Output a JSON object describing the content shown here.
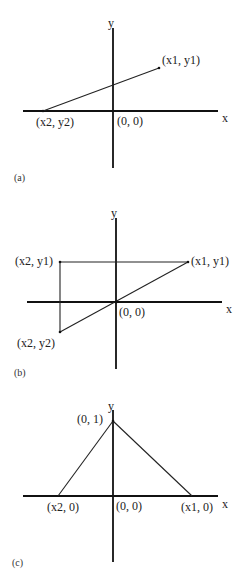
{
  "panels": [
    {
      "id": "a",
      "caption": "(a)",
      "axis_labels": {
        "x": "x",
        "y": "y"
      },
      "origin_label": "(0, 0)",
      "points": [
        {
          "name": "p1",
          "label": "(x1, y1)"
        },
        {
          "name": "p2",
          "label": "(x2, y2)"
        }
      ],
      "description": "Line segment from (x2, y2) on the negative x-axis to (x1, y1) in the first quadrant"
    },
    {
      "id": "b",
      "caption": "(b)",
      "axis_labels": {
        "x": "x",
        "y": "y"
      },
      "origin_label": "(0, 0)",
      "points": [
        {
          "name": "p1",
          "label": "(x1, y1)"
        },
        {
          "name": "p3",
          "label": "(x2, y1)"
        },
        {
          "name": "p2",
          "label": "(x2, y2)"
        }
      ],
      "description": "Right triangle through the origin with vertices (x1, y1), (x2, y1), (x2, y2)"
    },
    {
      "id": "c",
      "caption": "(c)",
      "axis_labels": {
        "x": "x",
        "y": "y"
      },
      "origin_label": "(0, 0)",
      "points": [
        {
          "name": "apex",
          "label": "(0, 1)"
        },
        {
          "name": "left",
          "label": "(x2, 0)"
        },
        {
          "name": "right",
          "label": "(x1, 0)"
        }
      ],
      "description": "Triangle (hat function) with apex (0, 1) and base points (x2, 0) and (x1, 0)"
    }
  ]
}
